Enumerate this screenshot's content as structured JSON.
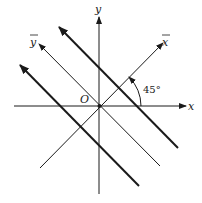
{
  "diagram": {
    "labels": {
      "x": "x",
      "y": "y",
      "x_bar": "x",
      "y_bar": "y",
      "origin": "O",
      "angle": "45°"
    },
    "colors": {
      "stroke": "#1a1a1a",
      "background": "#ffffff"
    }
  }
}
